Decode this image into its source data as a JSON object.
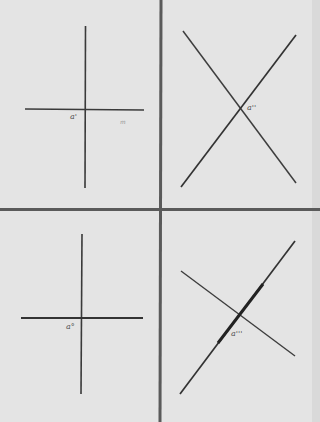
{
  "figure": {
    "background": "#e4e4e4",
    "line_color": "#3a3a3a",
    "divider_color": "#555555",
    "panels": [
      {
        "id": "top-left",
        "description": "perpendicular cross",
        "label": "a'",
        "secondary_label": "m"
      },
      {
        "id": "top-right",
        "description": "oblique X cross",
        "label": "a''"
      },
      {
        "id": "bottom-left",
        "description": "perpendicular cross",
        "label": "a°"
      },
      {
        "id": "bottom-right",
        "description": "oblique cross with thickened segment",
        "label": "a'''"
      }
    ]
  }
}
